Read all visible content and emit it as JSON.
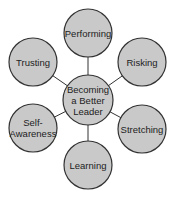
{
  "diagram": {
    "center": {
      "label_lines": [
        "Becoming",
        "a Better",
        "Leader"
      ],
      "cx": 88,
      "cy": 100,
      "r": 25
    },
    "nodes": [
      {
        "id": "performing",
        "label_lines": [
          "Performing"
        ],
        "cx": 88,
        "cy": 33,
        "r": 24
      },
      {
        "id": "risking",
        "label_lines": [
          "Risking"
        ],
        "cx": 142,
        "cy": 62,
        "r": 24
      },
      {
        "id": "stretching",
        "label_lines": [
          "Stretching"
        ],
        "cx": 142,
        "cy": 129,
        "r": 24
      },
      {
        "id": "learning",
        "label_lines": [
          "Learning"
        ],
        "cx": 88,
        "cy": 165,
        "r": 24
      },
      {
        "id": "self-awareness",
        "label_lines": [
          "Self-",
          "Awareness"
        ],
        "cx": 33,
        "cy": 128,
        "r": 24
      },
      {
        "id": "trusting",
        "label_lines": [
          "Trusting"
        ],
        "cx": 33,
        "cy": 62,
        "r": 24
      }
    ],
    "colors": {
      "fill": "#c9c9c9",
      "stroke": "#333333",
      "line": "#333333",
      "text": "#222222"
    }
  }
}
